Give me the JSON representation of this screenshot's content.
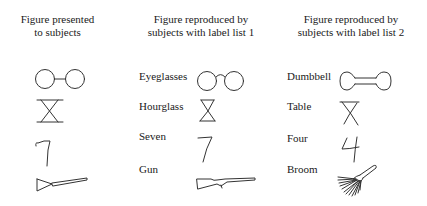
{
  "columns": [
    {
      "header": [
        "Figure presented",
        "to subjects"
      ],
      "items": [
        {
          "label": "",
          "figure": "eyeglasses-original"
        },
        {
          "label": "",
          "figure": "hourglass-original"
        },
        {
          "label": "",
          "figure": "seven-original"
        },
        {
          "label": "",
          "figure": "gun-original"
        }
      ]
    },
    {
      "header": [
        "Figure reproduced by",
        "subjects with label list 1"
      ],
      "items": [
        {
          "label": "Eyeglasses",
          "figure": "eyeglasses"
        },
        {
          "label": "Hourglass",
          "figure": "hourglass"
        },
        {
          "label": "Seven",
          "figure": "seven"
        },
        {
          "label": "Gun",
          "figure": "gun"
        }
      ]
    },
    {
      "header": [
        "Figure reproduced by",
        "subjects with label list 2"
      ],
      "items": [
        {
          "label": "Dumbbell",
          "figure": "dumbbell"
        },
        {
          "label": "Table",
          "figure": "table"
        },
        {
          "label": "Four",
          "figure": "four"
        },
        {
          "label": "Broom",
          "figure": "broom"
        }
      ]
    }
  ]
}
